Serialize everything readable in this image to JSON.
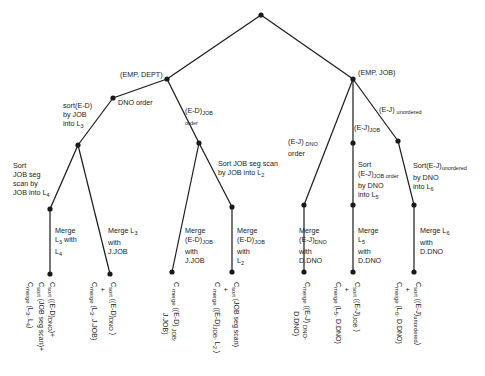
{
  "diagram": {
    "type": "query-plan-tree",
    "nodes": {
      "root": {
        "label": ""
      },
      "emp_dept": {
        "label": "(EMP, DEPT)"
      },
      "emp_job": {
        "label": "(EMP, JOB)"
      }
    },
    "edges": {
      "dno_order": "DNO order",
      "sort_ed_job_l3": "sort(E-D)\nby JOB\ninto L3",
      "ed_job_order": "(E-D)JOB\norder",
      "sort_job_seg_l4": "Sort\nJOB seg\nscan by\nJOB into L4",
      "merge_l3_l4": "Merge\nL3 with\nL4",
      "merge_l3_jjob": "Merge L3\nwith\nJ.JOB",
      "sort_job_seg_l2": "Sort JOB seg scan\nby JOB into L2",
      "merge_edjob_jjob": "Merge\n(E-D)JOB\nwith\nJ.JOB",
      "merge_edjob_l2": "Merge\n(E-D)JOB\nwith\nL2",
      "ej_dno_order": "(E-J) DNO\norder",
      "ej_job": "(E-J)JOB",
      "ej_unordered": "(E-J) unordered",
      "merge_ejdno_ddno": "Merge\n(E-J)DNO\nwith\nD.DNO",
      "sort_ejjob_l5": "Sort\n(E-J)JOB order\nby DNO\ninto L5",
      "merge_l5_ddno": "Merge\nL5\nwith\nD.DNO",
      "sort_ejunordered_l6": "Sort(E-J)unordered\nby DNO\ninto L6",
      "merge_l6_ddno": "Merge L6\nwith\nD.DNO"
    },
    "leaves": [
      {
        "cost": "Csort ((E-D)DNO)+\nCsort (JOB seg scan)+\nCmerge (L3, L4)"
      },
      {
        "cost": "Csort ((E-D)DNO )\n+\nCmerge (L3, J.JOB)"
      },
      {
        "cost": "Cmerge ((E-D)JOB,\nJ.JOB)"
      },
      {
        "cost": "Csort (JOB seg scan)\n+\nCmerge ((E-D)JOB, L2 )"
      },
      {
        "cost": "Cmerge ((E-J)DNO,\nD.DNO)"
      },
      {
        "cost": "Csort ((E-J)JOB )\n+\nCmerge (L5, D.DNO)"
      },
      {
        "cost": "Csort ((E-J)unordered)\n+\nCmerge (L6, D.DNO)"
      }
    ]
  },
  "colors": {
    "line": "#1a1a1a",
    "background": "#ffffff"
  }
}
